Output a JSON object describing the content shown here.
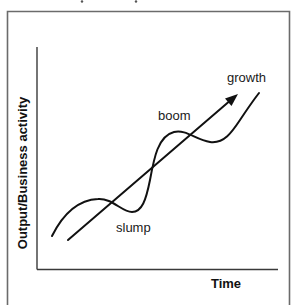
{
  "diagram": {
    "type": "business-cycle",
    "axes": {
      "y_label": "Output/Business activity",
      "x_label": "Time"
    },
    "annotations": {
      "growth": "growth",
      "boom": "boom",
      "slump": "slump"
    },
    "trend": {
      "description": "long-term growth trend arrow",
      "start": [
        68,
        240
      ],
      "end": [
        237,
        95
      ]
    },
    "cycle_curve": {
      "description": "fluctuating business activity around trend",
      "phases": [
        "slump",
        "boom",
        "growth"
      ]
    },
    "colors": {
      "lines": "#111111",
      "frame": "#6b6b6b",
      "background": "#ffffff"
    }
  }
}
